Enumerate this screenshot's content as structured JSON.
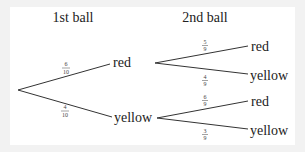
{
  "headers": {
    "first": "1st ball",
    "second": "2nd ball"
  },
  "first_level": [
    {
      "outcome": "red",
      "prob_num": "6",
      "prob_den": "10"
    },
    {
      "outcome": "yellow",
      "prob_num": "4",
      "prob_den": "10"
    }
  ],
  "second_level": {
    "after_red": [
      {
        "outcome": "red",
        "prob_num": "5",
        "prob_den": "9"
      },
      {
        "outcome": "yellow",
        "prob_num": "4",
        "prob_den": "9"
      }
    ],
    "after_yellow": [
      {
        "outcome": "red",
        "prob_num": "6",
        "prob_den": "9"
      },
      {
        "outcome": "yellow",
        "prob_num": "3",
        "prob_den": "9"
      }
    ]
  }
}
